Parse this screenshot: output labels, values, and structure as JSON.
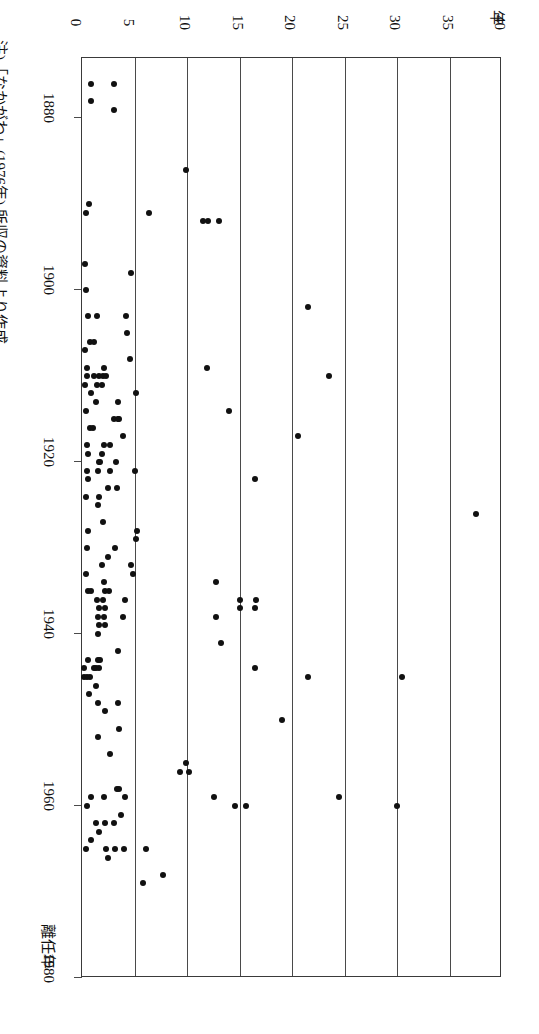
{
  "figure": {
    "orientation": "rotated-90-clockwise",
    "background": "#ffffff",
    "ink_color": "#111111",
    "frame_color": "#3a3a3a"
  },
  "value_axis": {
    "title": "年",
    "ticks": [
      "0",
      "5",
      "10",
      "15",
      "20",
      "25",
      "30",
      "35",
      "40"
    ],
    "min": 0,
    "max": 40,
    "gridlines": true
  },
  "year_axis": {
    "title": "離任年",
    "ticks": [
      "1880",
      "1900",
      "1920",
      "1940",
      "1960",
      "1980"
    ],
    "min": 1873,
    "max": 1980
  },
  "source_note": "注)「なかがわ」(1976年) 所収の資料より作成。",
  "bottom_caption": "",
  "chart_data": {
    "type": "scatter",
    "title": "",
    "xlabel": "離任年",
    "ylabel": "年",
    "xlim": [
      1873,
      1980
    ],
    "ylim": [
      0,
      40
    ],
    "grid": true,
    "legend": null,
    "note": "Scatter of tenure length (years, value axis 0-40) versus departure year (1873-1980). Figure is printed rotated 90 degrees.",
    "points": [
      {
        "year": 1876,
        "value": 0.9
      },
      {
        "year": 1876,
        "value": 3.0
      },
      {
        "year": 1878,
        "value": 0.9
      },
      {
        "year": 1879,
        "value": 3.0
      },
      {
        "year": 1886,
        "value": 9.9
      },
      {
        "year": 1890,
        "value": 0.7
      },
      {
        "year": 1891,
        "value": 0.4
      },
      {
        "year": 1891,
        "value": 6.4
      },
      {
        "year": 1892,
        "value": 12.0
      },
      {
        "year": 1892,
        "value": 13.0
      },
      {
        "year": 1892,
        "value": 11.5
      },
      {
        "year": 1897,
        "value": 0.3
      },
      {
        "year": 1898,
        "value": 4.7
      },
      {
        "year": 1900,
        "value": 0.4
      },
      {
        "year": 1902,
        "value": 21.5
      },
      {
        "year": 1903,
        "value": 0.6
      },
      {
        "year": 1903,
        "value": 1.4
      },
      {
        "year": 1903,
        "value": 4.2
      },
      {
        "year": 1905,
        "value": 4.3
      },
      {
        "year": 1906,
        "value": 0.8
      },
      {
        "year": 1906,
        "value": 1.1
      },
      {
        "year": 1907,
        "value": 0.3
      },
      {
        "year": 1908,
        "value": 4.6
      },
      {
        "year": 1909,
        "value": 0.5
      },
      {
        "year": 1909,
        "value": 2.1
      },
      {
        "year": 1909,
        "value": 11.9
      },
      {
        "year": 1910,
        "value": 0.5
      },
      {
        "year": 1910,
        "value": 1.1
      },
      {
        "year": 1910,
        "value": 1.6
      },
      {
        "year": 1910,
        "value": 2.0
      },
      {
        "year": 1910,
        "value": 2.3
      },
      {
        "year": 1910,
        "value": 23.5
      },
      {
        "year": 1911,
        "value": 0.3
      },
      {
        "year": 1911,
        "value": 1.4
      },
      {
        "year": 1911,
        "value": 1.9
      },
      {
        "year": 1912,
        "value": 0.9
      },
      {
        "year": 1912,
        "value": 5.1
      },
      {
        "year": 1913,
        "value": 1.3
      },
      {
        "year": 1913,
        "value": 3.4
      },
      {
        "year": 1914,
        "value": 0.4
      },
      {
        "year": 1914,
        "value": 14.0
      },
      {
        "year": 1915,
        "value": 3.0
      },
      {
        "year": 1915,
        "value": 3.4
      },
      {
        "year": 1915,
        "value": 3.5
      },
      {
        "year": 1916,
        "value": 0.8
      },
      {
        "year": 1916,
        "value": 1.0
      },
      {
        "year": 1917,
        "value": 3.9
      },
      {
        "year": 1917,
        "value": 20.6
      },
      {
        "year": 1918,
        "value": 0.5
      },
      {
        "year": 1918,
        "value": 2.1
      },
      {
        "year": 1918,
        "value": 2.7
      },
      {
        "year": 1919,
        "value": 0.6
      },
      {
        "year": 1919,
        "value": 1.9
      },
      {
        "year": 1920,
        "value": 1.6
      },
      {
        "year": 1920,
        "value": 1.7
      },
      {
        "year": 1920,
        "value": 3.2
      },
      {
        "year": 1921,
        "value": 0.5
      },
      {
        "year": 1921,
        "value": 1.5
      },
      {
        "year": 1921,
        "value": 2.7
      },
      {
        "year": 1921,
        "value": 5.0
      },
      {
        "year": 1922,
        "value": 0.6
      },
      {
        "year": 1922,
        "value": 16.5
      },
      {
        "year": 1923,
        "value": 2.5
      },
      {
        "year": 1923,
        "value": 3.3
      },
      {
        "year": 1924,
        "value": 0.4
      },
      {
        "year": 1924,
        "value": 1.6
      },
      {
        "year": 1925,
        "value": 1.5
      },
      {
        "year": 1926,
        "value": 37.5
      },
      {
        "year": 1927,
        "value": 2.0
      },
      {
        "year": 1928,
        "value": 0.6
      },
      {
        "year": 1928,
        "value": 5.2
      },
      {
        "year": 1929,
        "value": 5.1
      },
      {
        "year": 1930,
        "value": 0.5
      },
      {
        "year": 1930,
        "value": 3.1
      },
      {
        "year": 1931,
        "value": 2.5
      },
      {
        "year": 1932,
        "value": 4.7
      },
      {
        "year": 1932,
        "value": 1.9
      },
      {
        "year": 1933,
        "value": 0.4
      },
      {
        "year": 1933,
        "value": 4.9
      },
      {
        "year": 1934,
        "value": 2.1
      },
      {
        "year": 1934,
        "value": 12.8
      },
      {
        "year": 1935,
        "value": 0.6
      },
      {
        "year": 1935,
        "value": 0.9
      },
      {
        "year": 1935,
        "value": 2.2
      },
      {
        "year": 1935,
        "value": 2.6
      },
      {
        "year": 1936,
        "value": 1.4
      },
      {
        "year": 1936,
        "value": 2.0
      },
      {
        "year": 1936,
        "value": 4.1
      },
      {
        "year": 1936,
        "value": 15.0
      },
      {
        "year": 1936,
        "value": 16.6
      },
      {
        "year": 1937,
        "value": 1.6
      },
      {
        "year": 1937,
        "value": 2.2
      },
      {
        "year": 1937,
        "value": 15.0
      },
      {
        "year": 1937,
        "value": 16.5
      },
      {
        "year": 1938,
        "value": 1.5
      },
      {
        "year": 1938,
        "value": 2.1
      },
      {
        "year": 1938,
        "value": 3.9
      },
      {
        "year": 1938,
        "value": 12.8
      },
      {
        "year": 1939,
        "value": 1.6
      },
      {
        "year": 1939,
        "value": 2.2
      },
      {
        "year": 1940,
        "value": 1.5
      },
      {
        "year": 1941,
        "value": 13.2
      },
      {
        "year": 1942,
        "value": 3.4
      },
      {
        "year": 1943,
        "value": 0.6
      },
      {
        "year": 1943,
        "value": 1.5
      },
      {
        "year": 1943,
        "value": 1.7
      },
      {
        "year": 1944,
        "value": 0.2
      },
      {
        "year": 1944,
        "value": 1.1
      },
      {
        "year": 1944,
        "value": 1.3
      },
      {
        "year": 1944,
        "value": 1.6
      },
      {
        "year": 1944,
        "value": 16.5
      },
      {
        "year": 1945,
        "value": 0.2
      },
      {
        "year": 1945,
        "value": 0.5
      },
      {
        "year": 1945,
        "value": 0.8
      },
      {
        "year": 1945,
        "value": 21.5
      },
      {
        "year": 1945,
        "value": 30.5
      },
      {
        "year": 1946,
        "value": 1.3
      },
      {
        "year": 1947,
        "value": 0.7
      },
      {
        "year": 1948,
        "value": 1.5
      },
      {
        "year": 1948,
        "value": 3.4
      },
      {
        "year": 1949,
        "value": 2.2
      },
      {
        "year": 1950,
        "value": 19.0
      },
      {
        "year": 1951,
        "value": 3.5
      },
      {
        "year": 1952,
        "value": 1.5
      },
      {
        "year": 1954,
        "value": 2.7
      },
      {
        "year": 1955,
        "value": 9.9
      },
      {
        "year": 1956,
        "value": 10.2
      },
      {
        "year": 1956,
        "value": 9.3
      },
      {
        "year": 1958,
        "value": 3.3
      },
      {
        "year": 1958,
        "value": 3.5
      },
      {
        "year": 1959,
        "value": 0.9
      },
      {
        "year": 1959,
        "value": 2.1
      },
      {
        "year": 1959,
        "value": 4.1
      },
      {
        "year": 1959,
        "value": 12.6
      },
      {
        "year": 1959,
        "value": 24.5
      },
      {
        "year": 1960,
        "value": 0.5
      },
      {
        "year": 1960,
        "value": 30.0
      },
      {
        "year": 1960,
        "value": 14.6
      },
      {
        "year": 1960,
        "value": 15.6
      },
      {
        "year": 1961,
        "value": 3.7
      },
      {
        "year": 1962,
        "value": 1.3
      },
      {
        "year": 1962,
        "value": 2.2
      },
      {
        "year": 1962,
        "value": 3.0
      },
      {
        "year": 1963,
        "value": 1.6
      },
      {
        "year": 1964,
        "value": 0.9
      },
      {
        "year": 1965,
        "value": 0.4
      },
      {
        "year": 1965,
        "value": 2.3
      },
      {
        "year": 1965,
        "value": 3.1
      },
      {
        "year": 1965,
        "value": 4.0
      },
      {
        "year": 1965,
        "value": 6.1
      },
      {
        "year": 1966,
        "value": 2.5
      },
      {
        "year": 1968,
        "value": 7.7
      },
      {
        "year": 1969,
        "value": 5.8
      }
    ]
  }
}
